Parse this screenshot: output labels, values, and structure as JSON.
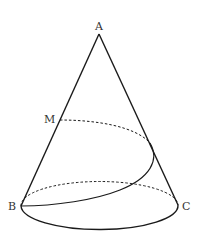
{
  "diagram": {
    "type": "cone-with-helix-path",
    "labels": {
      "apex": "A",
      "point_on_generatrix": "M",
      "base_left": "B",
      "base_right": "C"
    },
    "colors": {
      "stroke": "#1a1a1a",
      "label": "#333333",
      "background": "#ffffff"
    }
  }
}
